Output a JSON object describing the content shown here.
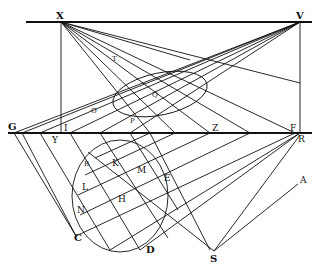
{
  "figure": {
    "type": "perspective-construction"
  },
  "labels": {
    "X": "X",
    "V": "V",
    "T": "T",
    "O": "O",
    "Q": "Q",
    "P": "P",
    "G": "G",
    "I": "I",
    "Y": "Y",
    "Z": "Z",
    "F": "F",
    "R": "R",
    "B": "B",
    "K": "K",
    "M": "M",
    "L": "L",
    "E": "E",
    "H": "H",
    "N": "N",
    "C": "C",
    "D": "D",
    "S": "S",
    "A": "A"
  },
  "colors": {
    "ink": "#111111",
    "paper": "#ffffff"
  }
}
